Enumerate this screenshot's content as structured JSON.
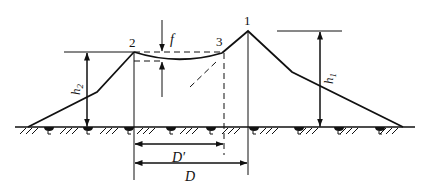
{
  "diagram": {
    "type": "embankment-cross-section",
    "colors": {
      "line": "#111111",
      "background": "#ffffff"
    },
    "points": [
      {
        "id": "p1",
        "label": "1"
      },
      {
        "id": "p2",
        "label": "2"
      },
      {
        "id": "p3",
        "label": "3"
      }
    ],
    "dimensions": {
      "sag": "f",
      "left_height": "h",
      "left_height_sub": "2",
      "right_height": "h",
      "right_height_sub": "1",
      "span_partial": "D′",
      "span_full": "D"
    }
  }
}
